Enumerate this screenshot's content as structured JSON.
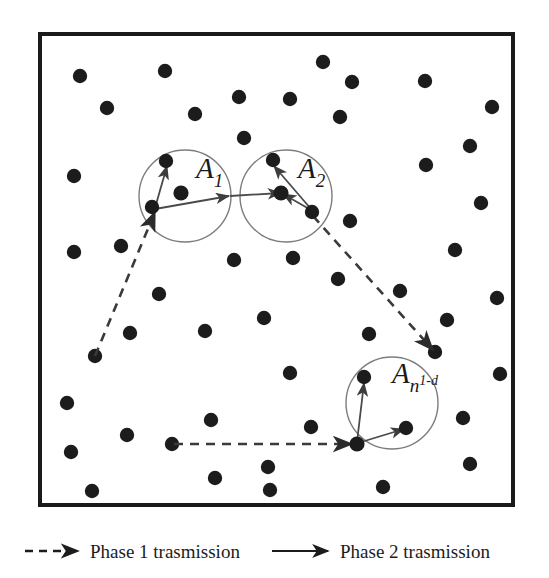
{
  "figure": {
    "background_color": "#ffffff",
    "border_color": "#1a1a1a",
    "node_color": "#1c1c1c",
    "circle_color": "#7d7d7d",
    "arrow_color": "#4a4a4a",
    "dashed_color": "#3a3a3a"
  },
  "area_border": {
    "x": 40,
    "y": 34,
    "width": 473,
    "height": 471,
    "stroke_width": 4
  },
  "clusters": [
    {
      "name": "cluster-a1",
      "label": "A",
      "subscript": "1",
      "superscript": "",
      "label_x": 196,
      "label_y": 178,
      "cx": 185,
      "cy": 196,
      "r": 46,
      "hub": {
        "x": 181,
        "y": 193
      },
      "members": [
        {
          "x": 166,
          "y": 161
        },
        {
          "x": 152,
          "y": 207
        }
      ]
    },
    {
      "name": "cluster-a2",
      "label": "A",
      "subscript": "2",
      "superscript": "",
      "label_x": 298,
      "label_y": 178,
      "cx": 286,
      "cy": 196,
      "r": 46,
      "hub": {
        "x": 281,
        "y": 193
      },
      "members": [
        {
          "x": 273,
          "y": 160
        },
        {
          "x": 312,
          "y": 212
        }
      ]
    },
    {
      "name": "cluster-an1d",
      "label": "A",
      "subscript": "n",
      "superscript": "1-d",
      "label_x": 392,
      "label_y": 383,
      "cx": 392,
      "cy": 403,
      "r": 46,
      "hub": {
        "x": 357,
        "y": 444
      },
      "members": [
        {
          "x": 364,
          "y": 377
        },
        {
          "x": 406,
          "y": 428
        }
      ]
    }
  ],
  "dots": [
    {
      "x": 80,
      "y": 76
    },
    {
      "x": 165,
      "y": 71
    },
    {
      "x": 239,
      "y": 97
    },
    {
      "x": 323,
      "y": 62
    },
    {
      "x": 352,
      "y": 82
    },
    {
      "x": 425,
      "y": 81
    },
    {
      "x": 492,
      "y": 107
    },
    {
      "x": 107,
      "y": 108
    },
    {
      "x": 340,
      "y": 117
    },
    {
      "x": 290,
      "y": 99
    },
    {
      "x": 470,
      "y": 146
    },
    {
      "x": 74,
      "y": 176
    },
    {
      "x": 244,
      "y": 138
    },
    {
      "x": 426,
      "y": 165
    },
    {
      "x": 481,
      "y": 203
    },
    {
      "x": 350,
      "y": 221
    },
    {
      "x": 74,
      "y": 252
    },
    {
      "x": 234,
      "y": 260
    },
    {
      "x": 293,
      "y": 258
    },
    {
      "x": 455,
      "y": 250
    },
    {
      "x": 95,
      "y": 356
    },
    {
      "x": 338,
      "y": 279
    },
    {
      "x": 400,
      "y": 291
    },
    {
      "x": 159,
      "y": 294
    },
    {
      "x": 130,
      "y": 333
    },
    {
      "x": 205,
      "y": 331
    },
    {
      "x": 435,
      "y": 352
    },
    {
      "x": 67,
      "y": 403
    },
    {
      "x": 264,
      "y": 318
    },
    {
      "x": 290,
      "y": 373
    },
    {
      "x": 71,
      "y": 452
    },
    {
      "x": 127,
      "y": 435
    },
    {
      "x": 172,
      "y": 444
    },
    {
      "x": 211,
      "y": 420
    },
    {
      "x": 215,
      "y": 478
    },
    {
      "x": 92,
      "y": 491
    },
    {
      "x": 268,
      "y": 467
    },
    {
      "x": 311,
      "y": 427
    },
    {
      "x": 270,
      "y": 490
    },
    {
      "x": 383,
      "y": 487
    },
    {
      "x": 470,
      "y": 464
    },
    {
      "x": 463,
      "y": 418
    },
    {
      "x": 447,
      "y": 320
    },
    {
      "x": 497,
      "y": 298
    },
    {
      "x": 500,
      "y": 374
    },
    {
      "x": 121,
      "y": 246
    },
    {
      "x": 195,
      "y": 114
    },
    {
      "x": 369,
      "y": 334
    }
  ],
  "phase1_links": [
    {
      "name": "phase1-link-left",
      "x1": 95,
      "y1": 356,
      "x2": 155,
      "y2": 212
    },
    {
      "name": "phase1-link-right",
      "x1": 313,
      "y1": 216,
      "x2": 433,
      "y2": 350
    },
    {
      "name": "phase1-link-bottom",
      "x1": 174,
      "y1": 444,
      "x2": 352,
      "y2": 444
    }
  ],
  "phase2_links": [
    {
      "name": "phase2-a1-up",
      "x1": 155,
      "y1": 208,
      "x2": 167,
      "y2": 166
    },
    {
      "name": "phase2-a1-hub",
      "x1": 155,
      "y1": 209,
      "x2": 229,
      "y2": 196
    },
    {
      "name": "phase2-a1-to-a2",
      "x1": 230,
      "y1": 196,
      "x2": 281,
      "y2": 193
    },
    {
      "name": "phase2-a2-up",
      "x1": 311,
      "y1": 209,
      "x2": 274,
      "y2": 166
    },
    {
      "name": "phase2-a2-hub",
      "x1": 311,
      "y1": 210,
      "x2": 283,
      "y2": 194
    },
    {
      "name": "phase2-an-up",
      "x1": 357,
      "y1": 442,
      "x2": 364,
      "y2": 383
    },
    {
      "name": "phase2-an-right",
      "x1": 358,
      "y1": 443,
      "x2": 404,
      "y2": 429
    }
  ],
  "legend": {
    "phase1": {
      "label": "Phase 1 trasmission",
      "line_style": "dashed",
      "text_x": 90,
      "text_y": 558,
      "line_x1": 25,
      "line_x2": 78,
      "line_y": 551
    },
    "phase2": {
      "label": "Phase 2 trasmission",
      "line_style": "solid",
      "text_x": 340,
      "text_y": 558,
      "line_x1": 272,
      "line_x2": 328,
      "line_y": 551
    }
  }
}
